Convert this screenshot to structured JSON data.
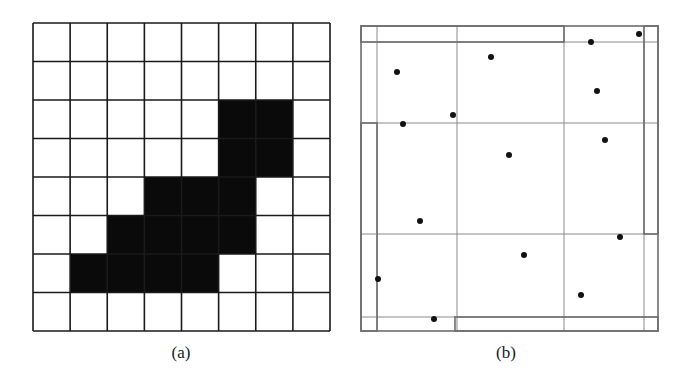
{
  "panel_a": {
    "label": "(a)",
    "rows": 8,
    "cols": 8,
    "origin": [
      33,
      23
    ],
    "size": [
      297,
      308
    ],
    "line_color": "#1a1a1a",
    "fill_color": "#0a0a0a",
    "filled_cells": [
      [
        2,
        5
      ],
      [
        2,
        6
      ],
      [
        3,
        5
      ],
      [
        3,
        6
      ],
      [
        4,
        3
      ],
      [
        4,
        4
      ],
      [
        4,
        5
      ],
      [
        5,
        2
      ],
      [
        5,
        3
      ],
      [
        5,
        4
      ],
      [
        5,
        5
      ],
      [
        6,
        1
      ],
      [
        6,
        2
      ],
      [
        6,
        3
      ],
      [
        6,
        4
      ]
    ]
  },
  "panel_b": {
    "label": "(b)",
    "outer_box": [
      361,
      26,
      658,
      331
    ],
    "line_color": "#8a8a8a",
    "dot_color": "#111111",
    "vertical_lines": [
      {
        "x": 377,
        "y1": 26,
        "y2": 331
      },
      {
        "x": 457,
        "y1": 26,
        "y2": 331
      },
      {
        "x": 564,
        "y1": 26,
        "y2": 331
      },
      {
        "x": 644,
        "y1": 26,
        "y2": 331
      }
    ],
    "horizontal_lines": [
      {
        "y": 42,
        "x1": 361,
        "x2": 658
      },
      {
        "y": 123,
        "x1": 361,
        "x2": 658
      },
      {
        "y": 234,
        "x1": 361,
        "x2": 658
      },
      {
        "y": 317,
        "x1": 361,
        "x2": 658
      }
    ],
    "boundary_boxes": [
      {
        "name": "top-strip-box",
        "x": 361,
        "y": 26,
        "w": 203,
        "h": 16
      },
      {
        "name": "right-strip-box",
        "x": 644,
        "y": 26,
        "w": 14,
        "h": 208
      },
      {
        "name": "left-strip-box",
        "x": 361,
        "y": 123,
        "w": 16,
        "h": 208
      },
      {
        "name": "bottom-strip-box",
        "x": 455,
        "y": 317,
        "w": 203,
        "h": 14
      }
    ],
    "points": [
      [
        397,
        72
      ],
      [
        491,
        57
      ],
      [
        591,
        42
      ],
      [
        639,
        34
      ],
      [
        453,
        115
      ],
      [
        403,
        124
      ],
      [
        597,
        91
      ],
      [
        509,
        155
      ],
      [
        605,
        140
      ],
      [
        420,
        221
      ],
      [
        620,
        237
      ],
      [
        524,
        255
      ],
      [
        378,
        279
      ],
      [
        581,
        295
      ],
      [
        434,
        319
      ]
    ]
  }
}
